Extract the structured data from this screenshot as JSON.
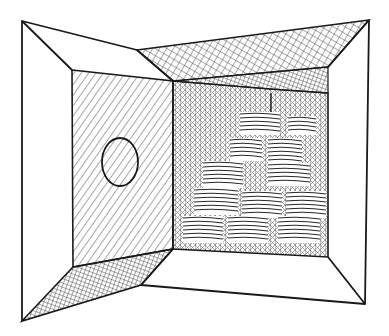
{
  "illustration": {
    "title": "Open box interior with stacked plates",
    "colors": {
      "ink": "#1a1a1a",
      "paper": "#ffffff",
      "hatch": "#3a3a3a"
    },
    "outer_frame": {
      "top_left": [
        22,
        21
      ],
      "top_right": [
        369,
        20
      ],
      "bottom_right": [
        365,
        304
      ],
      "bottom_left": [
        22,
        321
      ]
    },
    "left_panel": {
      "top_left": [
        72,
        70
      ],
      "top_right": [
        173,
        81
      ],
      "bottom_right": [
        173,
        249
      ],
      "bottom_left": [
        73,
        267
      ],
      "porthole": {
        "cx": 120,
        "cy": 162,
        "rx": 18,
        "ry": 24
      }
    },
    "back_wall": {
      "top_left": [
        173,
        81
      ],
      "top_right": [
        328,
        67
      ],
      "bottom_right": [
        328,
        257
      ],
      "bottom_left": [
        173,
        249
      ]
    },
    "creases": {
      "top": [
        137,
        50
      ],
      "bottom": [
        141,
        285
      ]
    },
    "plate_stacks": [
      {
        "x": 240,
        "y": 114,
        "w": 40,
        "rows": 5
      },
      {
        "x": 288,
        "y": 118,
        "w": 28,
        "rows": 4
      },
      {
        "x": 230,
        "y": 140,
        "w": 32,
        "rows": 5
      },
      {
        "x": 268,
        "y": 140,
        "w": 34,
        "rows": 6
      },
      {
        "x": 203,
        "y": 163,
        "w": 40,
        "rows": 6
      },
      {
        "x": 268,
        "y": 165,
        "w": 42,
        "rows": 5
      },
      {
        "x": 194,
        "y": 190,
        "w": 44,
        "rows": 6
      },
      {
        "x": 242,
        "y": 193,
        "w": 40,
        "rows": 6
      },
      {
        "x": 286,
        "y": 193,
        "w": 40,
        "rows": 6
      },
      {
        "x": 183,
        "y": 218,
        "w": 40,
        "rows": 6
      },
      {
        "x": 228,
        "y": 218,
        "w": 40,
        "rows": 6
      },
      {
        "x": 278,
        "y": 218,
        "w": 42,
        "rows": 6
      }
    ]
  }
}
